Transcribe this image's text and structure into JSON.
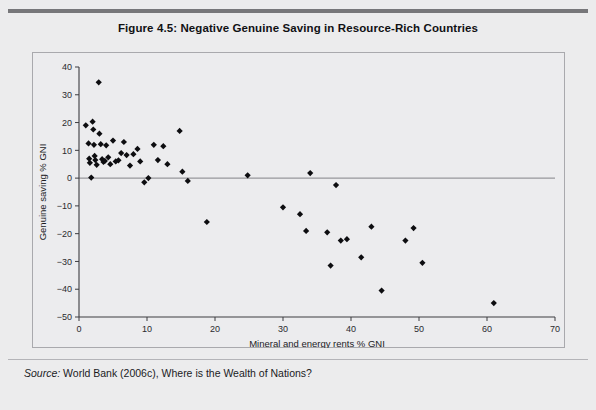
{
  "figure": {
    "title": "Figure 4.5: Negative Genuine Saving in Resource-Rich Countries",
    "source_label": "Source:",
    "source_text": " World Bank (2006c), Where is the Wealth of Nations?"
  },
  "colors": {
    "page_background": "#ececed",
    "plot_background": "#ececee",
    "point": "#0d0d10",
    "axis": "#3c3c40",
    "zero_line": "#97979b",
    "frame_border": "#a9a9ad",
    "top_rule": "#77777a"
  },
  "chart_data": {
    "type": "scatter",
    "title": "Figure 4.5: Negative Genuine Saving in Resource-Rich Countries",
    "xlabel": "Mineral and energy rents % GNI",
    "ylabel": "Genuine saving % GNI",
    "xlim": [
      0,
      70
    ],
    "ylim": [
      -50,
      40
    ],
    "xticks": [
      0,
      10,
      20,
      30,
      40,
      50,
      60,
      70
    ],
    "yticks": [
      -50,
      -40,
      -30,
      -20,
      -10,
      0,
      10,
      20,
      30,
      40
    ],
    "xtick_labels": [
      "0",
      "10",
      "20",
      "30",
      "40",
      "50",
      "60",
      "70"
    ],
    "ytick_labels": [
      "-50",
      "-40",
      "-30",
      "-20",
      "-10",
      "0",
      "10",
      "20",
      "30",
      "40"
    ],
    "grid": false,
    "legend": null,
    "reference_lines": [
      {
        "axis": "y",
        "value": 0
      }
    ],
    "marker": "diamond",
    "series": [
      {
        "name": "Countries",
        "points": [
          [
            1.0,
            19.0
          ],
          [
            1.4,
            12.5
          ],
          [
            1.5,
            7.0
          ],
          [
            1.6,
            5.5
          ],
          [
            1.8,
            0.2
          ],
          [
            2.0,
            20.3
          ],
          [
            2.1,
            17.5
          ],
          [
            2.2,
            12.0
          ],
          [
            2.3,
            8.0
          ],
          [
            2.4,
            6.5
          ],
          [
            2.6,
            4.8
          ],
          [
            2.9,
            34.5
          ],
          [
            3.0,
            16.0
          ],
          [
            3.2,
            12.2
          ],
          [
            3.4,
            6.8
          ],
          [
            3.6,
            5.8
          ],
          [
            3.8,
            6.2
          ],
          [
            4.0,
            11.8
          ],
          [
            4.3,
            7.5
          ],
          [
            4.6,
            5.0
          ],
          [
            5.0,
            13.5
          ],
          [
            5.4,
            6.0
          ],
          [
            5.8,
            6.4
          ],
          [
            6.2,
            9.0
          ],
          [
            6.6,
            13.0
          ],
          [
            7.0,
            8.3
          ],
          [
            7.5,
            4.5
          ],
          [
            8.0,
            8.6
          ],
          [
            8.6,
            10.5
          ],
          [
            9.0,
            6.0
          ],
          [
            9.6,
            -1.5
          ],
          [
            10.2,
            0.0
          ],
          [
            11.0,
            12.0
          ],
          [
            11.6,
            6.5
          ],
          [
            12.4,
            11.5
          ],
          [
            13.0,
            5.0
          ],
          [
            14.8,
            17.0
          ],
          [
            15.2,
            2.3
          ],
          [
            16.0,
            -1.0
          ],
          [
            18.8,
            -15.8
          ],
          [
            24.8,
            1.0
          ],
          [
            30.0,
            -10.5
          ],
          [
            32.5,
            -13.0
          ],
          [
            33.4,
            -19.0
          ],
          [
            34.0,
            1.8
          ],
          [
            36.5,
            -19.5
          ],
          [
            37.0,
            -31.5
          ],
          [
            37.8,
            -2.5
          ],
          [
            38.5,
            -22.5
          ],
          [
            39.4,
            -22.0
          ],
          [
            41.5,
            -28.5
          ],
          [
            43.0,
            -17.5
          ],
          [
            44.5,
            -40.5
          ],
          [
            48.0,
            -22.5
          ],
          [
            49.2,
            -18.0
          ],
          [
            50.5,
            -30.5
          ],
          [
            61.0,
            -45.0
          ]
        ]
      }
    ]
  }
}
